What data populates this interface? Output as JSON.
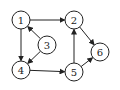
{
  "graph": {
    "type": "directed",
    "nodes": [
      {
        "id": "1",
        "label": "1",
        "x": 21,
        "y": 20
      },
      {
        "id": "2",
        "label": "2",
        "x": 74,
        "y": 20
      },
      {
        "id": "3",
        "label": "3",
        "x": 47,
        "y": 45
      },
      {
        "id": "4",
        "label": "4",
        "x": 21,
        "y": 70
      },
      {
        "id": "5",
        "label": "5",
        "x": 74,
        "y": 72
      },
      {
        "id": "6",
        "label": "6",
        "x": 100,
        "y": 52
      }
    ],
    "edges": [
      {
        "from": "1",
        "to": "2"
      },
      {
        "from": "1",
        "to": "4"
      },
      {
        "from": "3",
        "to": "1"
      },
      {
        "from": "3",
        "to": "4"
      },
      {
        "from": "4",
        "to": "5"
      },
      {
        "from": "5",
        "to": "2"
      },
      {
        "from": "2",
        "to": "6"
      },
      {
        "from": "5",
        "to": "6"
      }
    ],
    "node_radius": 9,
    "stroke_color": "#222222",
    "fill_color": "#ffffff"
  }
}
